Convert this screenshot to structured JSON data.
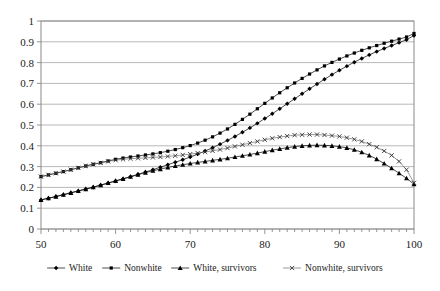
{
  "chart_data": {
    "type": "line",
    "title": "",
    "subtitle": "",
    "xlabel": "",
    "ylabel": "",
    "xlim": [
      50,
      100
    ],
    "ylim": [
      0,
      1
    ],
    "xticks": [
      50,
      60,
      70,
      80,
      90,
      100
    ],
    "xtick_labels": [
      "50",
      "60",
      "70",
      "80",
      "90",
      "100"
    ],
    "yticks": [
      0,
      0.1,
      0.2,
      0.3,
      0.4,
      0.5,
      0.6,
      0.7,
      0.8,
      0.9,
      1
    ],
    "ytick_labels": [
      "0",
      "0.1",
      "0.2",
      "0.3",
      "0.4",
      "0.5",
      "0.6",
      "0.7",
      "0.8",
      "0.9",
      "1"
    ],
    "grid": "horizontal",
    "legend_position": "bottom",
    "x": [
      50,
      51,
      52,
      53,
      54,
      55,
      56,
      57,
      58,
      59,
      60,
      61,
      62,
      63,
      64,
      65,
      66,
      67,
      68,
      69,
      70,
      71,
      72,
      73,
      74,
      75,
      76,
      77,
      78,
      79,
      80,
      81,
      82,
      83,
      84,
      85,
      86,
      87,
      88,
      89,
      90,
      91,
      92,
      93,
      94,
      95,
      96,
      97,
      98,
      99,
      100
    ],
    "series": [
      {
        "name": "White",
        "marker": "diamond",
        "values": [
          0.14,
          0.148,
          0.156,
          0.165,
          0.174,
          0.183,
          0.192,
          0.201,
          0.211,
          0.221,
          0.231,
          0.241,
          0.252,
          0.263,
          0.274,
          0.285,
          0.297,
          0.309,
          0.321,
          0.333,
          0.346,
          0.36,
          0.375,
          0.391,
          0.408,
          0.426,
          0.445,
          0.465,
          0.486,
          0.508,
          0.531,
          0.554,
          0.578,
          0.602,
          0.626,
          0.65,
          0.674,
          0.697,
          0.72,
          0.742,
          0.763,
          0.783,
          0.802,
          0.82,
          0.837,
          0.853,
          0.868,
          0.882,
          0.896,
          0.91,
          0.93
        ]
      },
      {
        "name": "Nonwhite",
        "marker": "square",
        "values": [
          0.252,
          0.26,
          0.268,
          0.276,
          0.285,
          0.294,
          0.303,
          0.311,
          0.319,
          0.327,
          0.335,
          0.341,
          0.346,
          0.351,
          0.356,
          0.361,
          0.367,
          0.374,
          0.382,
          0.391,
          0.401,
          0.413,
          0.427,
          0.443,
          0.461,
          0.481,
          0.503,
          0.527,
          0.552,
          0.578,
          0.604,
          0.63,
          0.655,
          0.679,
          0.702,
          0.724,
          0.745,
          0.765,
          0.784,
          0.801,
          0.817,
          0.832,
          0.846,
          0.859,
          0.871,
          0.882,
          0.893,
          0.903,
          0.913,
          0.923,
          0.94
        ]
      },
      {
        "name": "White, survivors",
        "marker": "triangle",
        "values": [
          0.14,
          0.148,
          0.156,
          0.165,
          0.174,
          0.183,
          0.192,
          0.201,
          0.211,
          0.221,
          0.231,
          0.241,
          0.251,
          0.261,
          0.271,
          0.28,
          0.288,
          0.296,
          0.303,
          0.309,
          0.315,
          0.32,
          0.325,
          0.33,
          0.335,
          0.34,
          0.346,
          0.352,
          0.358,
          0.365,
          0.372,
          0.379,
          0.385,
          0.391,
          0.396,
          0.4,
          0.402,
          0.403,
          0.402,
          0.4,
          0.396,
          0.39,
          0.381,
          0.369,
          0.354,
          0.336,
          0.315,
          0.292,
          0.268,
          0.244,
          0.215
        ]
      },
      {
        "name": "Nonwhite, survivors",
        "marker": "x",
        "values": [
          0.252,
          0.26,
          0.268,
          0.276,
          0.285,
          0.294,
          0.303,
          0.311,
          0.318,
          0.325,
          0.331,
          0.335,
          0.338,
          0.34,
          0.342,
          0.344,
          0.346,
          0.349,
          0.352,
          0.356,
          0.36,
          0.365,
          0.37,
          0.376,
          0.382,
          0.389,
          0.397,
          0.405,
          0.413,
          0.421,
          0.429,
          0.436,
          0.442,
          0.447,
          0.451,
          0.453,
          0.454,
          0.454,
          0.452,
          0.449,
          0.445,
          0.439,
          0.431,
          0.421,
          0.408,
          0.393,
          0.375,
          0.354,
          0.325,
          0.285,
          0.222
        ]
      }
    ],
    "legend": [
      {
        "label": "White",
        "marker": "diamond"
      },
      {
        "label": "Nonwhite",
        "marker": "square"
      },
      {
        "label": "White, survivors",
        "marker": "triangle"
      },
      {
        "label": "Nonwhite, survivors",
        "marker": "x"
      }
    ],
    "colors": {
      "series_stroke": "#000000",
      "survivor_stroke": "#555555",
      "gridline": "#a6a6a6",
      "plot_border": "#8a8a8a",
      "background": "#ffffff"
    }
  }
}
